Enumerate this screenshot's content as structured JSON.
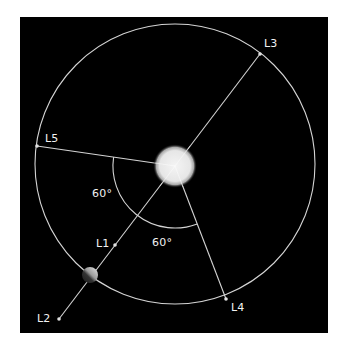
{
  "diagram": {
    "background_color": "#000000",
    "page_color": "#ffffff",
    "line_color": "#d9d9d9",
    "sun_color": "#eeeeee",
    "bodies": {
      "sun": {
        "name": "Sun"
      },
      "earth": {
        "name": "Earth"
      }
    },
    "points": [
      {
        "id": "L1",
        "label": "L1"
      },
      {
        "id": "L2",
        "label": "L2"
      },
      {
        "id": "L3",
        "label": "L3"
      },
      {
        "id": "L4",
        "label": "L4"
      },
      {
        "id": "L5",
        "label": "L5"
      }
    ],
    "angles": [
      {
        "label": "60°",
        "between": "L5 and Earth-Sun line"
      },
      {
        "label": "60°",
        "between": "Earth-Sun line and L4"
      }
    ]
  }
}
